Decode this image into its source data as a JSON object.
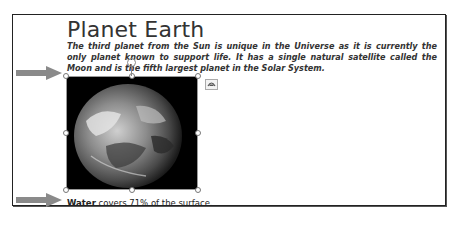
{
  "document": {
    "title": "Planet Earth",
    "intro_text": "The third planet from the Sun is unique in the Universe as it is currently the only planet known to support life. It has a single natural satellite called the Moon and is the fifth largest planet in the Solar System.",
    "image": {
      "description": "Earth globe photo on black background",
      "selected": true
    },
    "caption": {
      "bold_text": "Water",
      "rest_text": " covers 71% of the surface."
    }
  },
  "annotations": {
    "arrow_top": "arrow-pointing-right",
    "arrow_bottom": "arrow-pointing-right"
  },
  "controls": {
    "layout_options_icon": "layout-options-icon",
    "rotation_handle_icon": "rotate-handle-icon"
  },
  "colors": {
    "arrow": "#8a8a8a",
    "frame": "#222222",
    "text": "#333333"
  }
}
